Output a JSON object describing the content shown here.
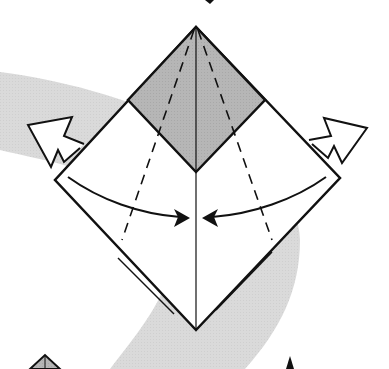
{
  "diagram": {
    "type": "origami-fold-instruction",
    "colors": {
      "background": "#ffffff",
      "paper_front": "#ffffff",
      "paper_colored": "#b4b4b4",
      "swoosh": "#dcdcdc",
      "line": "#111111"
    },
    "elements": {
      "top_flap": "shaded diamond (colored side)",
      "center_crease": "vertical center line",
      "valley_folds": [
        "left dashed line",
        "right dashed line"
      ],
      "fold_arrows": [
        "left curved arrow to center",
        "right curved arrow to center"
      ],
      "open_arrows": [
        "left hollow arrow up-left",
        "right hollow arrow up-right"
      ]
    }
  }
}
